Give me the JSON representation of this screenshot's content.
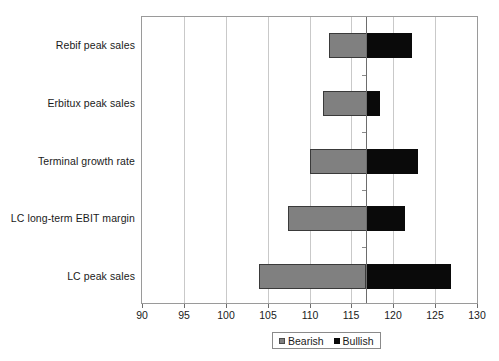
{
  "chart_data": {
    "type": "bar",
    "subtype": "tornado",
    "title": "",
    "xlabel": "",
    "ylabel": "",
    "xlim": [
      90,
      130
    ],
    "xticks": [
      90,
      95,
      100,
      105,
      110,
      115,
      120,
      125,
      130
    ],
    "xtick_labels": [
      "90",
      "95",
      "100",
      "105",
      "110",
      "115",
      "120",
      "125",
      "130"
    ],
    "grid": true,
    "grid_axis": "x",
    "base_value": 116.8,
    "legend_position": "bottom",
    "categories": [
      "Rebif peak sales",
      "Erbitux peak sales",
      "Terminal growth rate",
      "LC long-term EBIT margin",
      "LC peak sales"
    ],
    "series": [
      {
        "name": "Bearish",
        "color": "#808080",
        "values": [
          112.3,
          111.6,
          110.0,
          107.4,
          104.0
        ]
      },
      {
        "name": "Bullish",
        "color": "#0a0a0a",
        "values": [
          122.3,
          118.5,
          123.0,
          121.4,
          127.0
        ]
      }
    ]
  },
  "legend": {
    "items": [
      {
        "label": "Bearish",
        "swatch": "bearish-swatch"
      },
      {
        "label": "Bullish",
        "swatch": "bullish-swatch"
      }
    ]
  }
}
